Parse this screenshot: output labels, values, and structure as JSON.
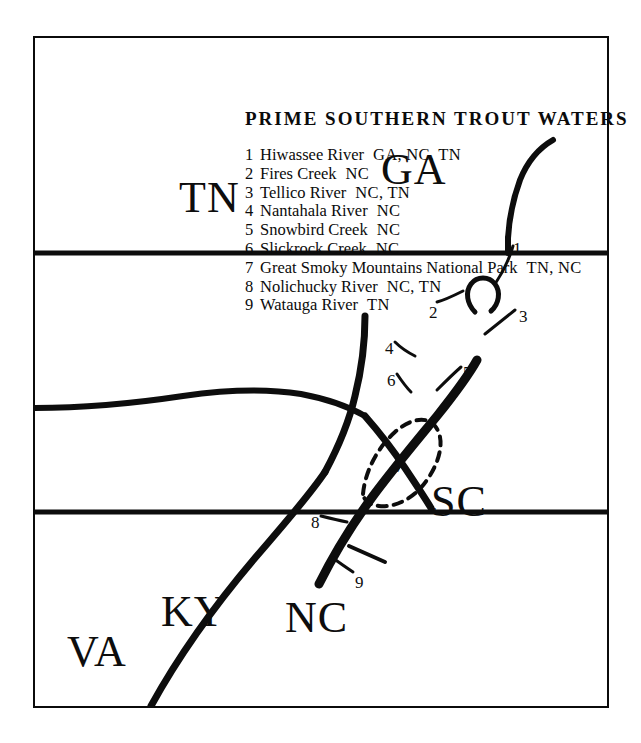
{
  "figure": {
    "kind": "line-map",
    "orientation": "rotated-90-ccw",
    "ink_color": "#0d0d0d",
    "paper_color": "#ffffff"
  },
  "map": {
    "states": [
      {
        "code": "KY",
        "name": "Kentucky"
      },
      {
        "code": "VA",
        "name": "Virginia"
      },
      {
        "code": "TN",
        "name": "Tennessee"
      },
      {
        "code": "NC",
        "name": "North Carolina"
      },
      {
        "code": "GA",
        "name": "Georgia"
      },
      {
        "code": "SC",
        "name": "South Carolina"
      }
    ],
    "site_markers": [
      "1",
      "2",
      "3",
      "4",
      "5",
      "6",
      "7",
      "8",
      "9"
    ]
  },
  "legend": {
    "title": "PRIME  SOUTHERN  TROUT  WATERS",
    "items": [
      {
        "index": "1",
        "name": "Hiwassee River",
        "states": "GA, NC, TN"
      },
      {
        "index": "2",
        "name": "Fires Creek",
        "states": "NC"
      },
      {
        "index": "3",
        "name": "Tellico River",
        "states": "NC, TN"
      },
      {
        "index": "4",
        "name": "Nantahala River",
        "states": "NC"
      },
      {
        "index": "5",
        "name": "Snowbird Creek",
        "states": "NC"
      },
      {
        "index": "6",
        "name": "Slickrock Creek",
        "states": "NC"
      },
      {
        "index": "7",
        "name": "Great Smoky Mountains National Park",
        "states": "TN, NC"
      },
      {
        "index": "8",
        "name": "Nolichucky River",
        "states": "NC, TN"
      },
      {
        "index": "9",
        "name": "Watauga River",
        "states": "TN"
      }
    ]
  }
}
